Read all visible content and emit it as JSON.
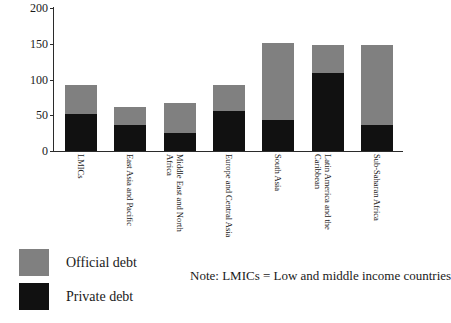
{
  "chart_data": {
    "type": "bar",
    "title": "",
    "xlabel": "",
    "ylabel": "",
    "ylim": [
      0,
      200
    ],
    "yticks": [
      0,
      50,
      100,
      150,
      200
    ],
    "grid": false,
    "stacked": true,
    "legend_position": "bottom-left",
    "categories": [
      "LMICs",
      "East Asia and Pacific",
      "Middle East and North Africa",
      "Europe and Central Asia",
      "South Asia",
      "Latin America and the Caribbean",
      "Sub-Saharan Africa"
    ],
    "series": [
      {
        "name": "Private debt",
        "color": "#111111",
        "values": [
          52,
          37,
          25,
          56,
          43,
          109,
          37
        ]
      },
      {
        "name": "Official debt",
        "color": "#808080",
        "values": [
          41,
          24,
          42,
          37,
          108,
          39,
          111
        ]
      }
    ],
    "totals": [
      93,
      61,
      67,
      93,
      151,
      148,
      148
    ],
    "annotations": [
      "Note: LMICs = Low and middle income countries"
    ]
  },
  "legend": {
    "items": [
      {
        "label": "Official debt",
        "color": "#808080"
      },
      {
        "label": "Private debt",
        "color": "#111111"
      }
    ]
  },
  "note": {
    "text": "Note: LMICs = Low and middle income countries"
  }
}
